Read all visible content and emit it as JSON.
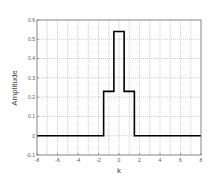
{
  "chart_data": {
    "type": "line",
    "style": "step",
    "title": "",
    "xlabel": "k",
    "ylabel": "Amplitude",
    "xlim": [
      -8,
      8
    ],
    "ylim": [
      -0.1,
      0.6
    ],
    "xticks": [
      -8,
      -6,
      -4,
      -2,
      0,
      2,
      4,
      6,
      8
    ],
    "xtick_labels": [
      "-8",
      "-6",
      "-4",
      "-2",
      "0",
      "2",
      "4",
      "6",
      "8"
    ],
    "yticks": [
      -0.1,
      0,
      0.1,
      0.2,
      0.3,
      0.4,
      0.5,
      0.6
    ],
    "ytick_labels": [
      "-0.1",
      "0",
      "0.1",
      "0.2",
      "0.3",
      "0.4",
      "0.5",
      "0.6"
    ],
    "grid": true,
    "grid_x_step": 1,
    "legend": null,
    "series": [
      {
        "name": "signal",
        "color": "#000000",
        "x": [
          -8,
          -7,
          -6,
          -5,
          -4,
          -3,
          -2,
          -1,
          0,
          1,
          2,
          3,
          4,
          5,
          6,
          7,
          8
        ],
        "values": [
          0,
          0,
          0,
          0,
          0,
          0,
          0,
          0.23,
          0.54,
          0.23,
          0,
          0,
          0,
          0,
          0,
          0,
          0
        ]
      }
    ]
  }
}
